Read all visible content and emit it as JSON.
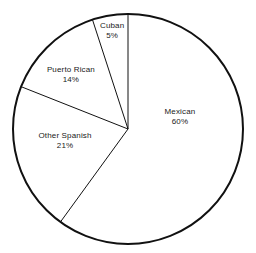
{
  "chart_data": {
    "type": "pie",
    "title": "",
    "subtitle": "",
    "xlabel": "",
    "ylabel": "",
    "legend": "none",
    "grid": false,
    "start_angle_deg": 0,
    "direction": "clockwise",
    "units": "percent",
    "categories": [
      "Mexican",
      "Other Spanish",
      "Puerto Rican",
      "Cuban"
    ],
    "values": [
      60,
      21,
      14,
      5
    ],
    "slices": [
      {
        "name": "Mexican",
        "value": 60,
        "value_label": "60%",
        "start_deg": 0,
        "end_deg": 216,
        "fill": "#ffffff",
        "label_x_pct": 70.3,
        "label_y_pct": 46.2
      },
      {
        "name": "Other Spanish",
        "value": 21,
        "value_label": "21%",
        "start_deg": 216,
        "end_deg": 291.6,
        "fill": "#ffffff",
        "label_x_pct": 25.4,
        "label_y_pct": 55.7
      },
      {
        "name": "Puerto Rican",
        "value": 14,
        "value_label": "14%",
        "start_deg": 291.6,
        "end_deg": 342,
        "fill": "#ffffff",
        "label_x_pct": 27.7,
        "label_y_pct": 29.6
      },
      {
        "name": "Cuban",
        "value": 5,
        "value_label": "5%",
        "start_deg": 342,
        "end_deg": 360,
        "fill": "#ffffff",
        "label_x_pct": 43.8,
        "label_y_pct": 12.3
      }
    ],
    "geometry": {
      "center_x": 128,
      "center_y": 129,
      "radius": 115,
      "outline_color": "#111111",
      "outline_width": 2,
      "divider_color": "#111111",
      "divider_width": 1
    }
  }
}
